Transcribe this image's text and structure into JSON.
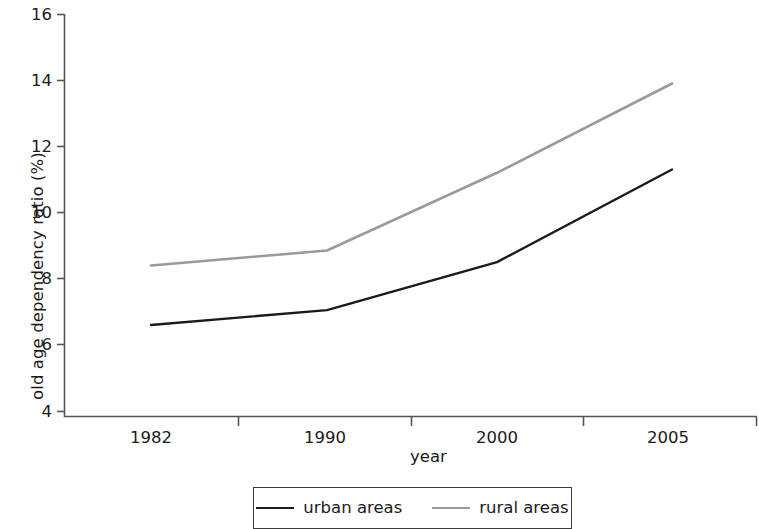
{
  "chart_data": {
    "type": "line",
    "title": "",
    "xlabel": "year",
    "ylabel": "old age dependency ratio (%)",
    "x": [
      "1982",
      "1990",
      "2000",
      "2005"
    ],
    "categories": [
      "1982",
      "1990",
      "2000",
      "2005"
    ],
    "xtick_labels": [
      "1982",
      "1990",
      "2000",
      "2005"
    ],
    "ytick_labels": [
      "16",
      "14",
      "12",
      "10",
      "8",
      "6",
      "4"
    ],
    "ytick_values": [
      16,
      14,
      12,
      10,
      8,
      6,
      4
    ],
    "ylim": [
      4,
      16
    ],
    "grid": false,
    "legend_position": "bottom-center",
    "series": [
      {
        "name": "urban areas",
        "color": "#1a1a1a",
        "values": [
          6.6,
          7.05,
          8.5,
          11.3
        ]
      },
      {
        "name": "rural areas",
        "color": "#9a9a9a",
        "values": [
          8.4,
          8.85,
          11.2,
          13.9
        ]
      }
    ]
  },
  "axes": {
    "y_title": "old age dependency ratio (%)",
    "x_title": "year",
    "axis_color": "#555555"
  },
  "legend": {
    "entries": [
      {
        "label": "urban areas",
        "color": "#1a1a1a",
        "width": 2.2
      },
      {
        "label": "rural areas",
        "color": "#9a9a9a",
        "width": 2.2
      }
    ]
  }
}
